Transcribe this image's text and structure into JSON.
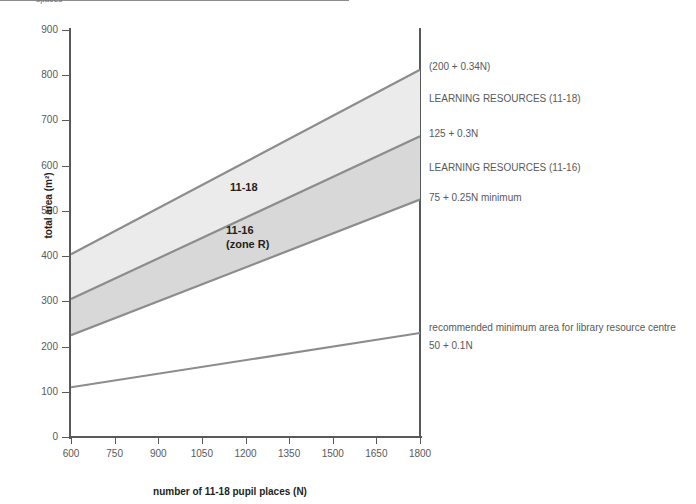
{
  "page": {
    "truncated_top_text": "spaces"
  },
  "chart_data": {
    "type": "area",
    "title": "",
    "xlabel": "number of 11-18 pupil places (N)",
    "ylabel": "total area (m²)",
    "xlim": [
      600,
      1800
    ],
    "ylim": [
      0,
      900
    ],
    "x_ticks": [
      600,
      750,
      900,
      1050,
      1200,
      1350,
      1500,
      1650,
      1800
    ],
    "y_ticks": [
      0,
      100,
      200,
      300,
      400,
      500,
      600,
      700,
      800,
      900
    ],
    "grid": false,
    "legend": "annotations at right of plot",
    "x": [
      600,
      1800
    ],
    "series": [
      {
        "name": "(200 + 0.34N)",
        "formula": "200 + 0.34N",
        "values": [
          404,
          812
        ],
        "role": "upper bound of 11-18 band",
        "color": "#8a8c8e"
      },
      {
        "name": "125 + 0.3N",
        "formula": "125 + 0.3N",
        "values": [
          305,
          665
        ],
        "role": "boundary between 11-18 and 11-16 bands",
        "color": "#8a8c8e"
      },
      {
        "name": "75 + 0.25N minimum",
        "formula": "75 + 0.25N",
        "values": [
          225,
          525
        ],
        "role": "lower bound of 11-16 band",
        "color": "#8a8c8e"
      },
      {
        "name": "50 + 0.1N",
        "formula": "50 + 0.1N",
        "values": [
          110,
          230
        ],
        "role": "recommended minimum area for library resource centre",
        "color": "#8a8c8e"
      }
    ],
    "bands": [
      {
        "name": "11-18",
        "label": "11-18",
        "upper_formula": "200 + 0.34N",
        "lower_formula": "125 + 0.3N",
        "fill": "#ebebeb"
      },
      {
        "name": "11-16 (zone R)",
        "label": "11-16\n(zone R)",
        "upper_formula": "125 + 0.3N",
        "lower_formula": "75 + 0.25N",
        "fill": "#d8d8d8"
      }
    ],
    "annotations": [
      {
        "text": "(200 + 0.34N)"
      },
      {
        "text": "LEARNING RESOURCES (11-18)"
      },
      {
        "text": "125 + 0.3N"
      },
      {
        "text": "LEARNING RESOURCES (11-16)"
      },
      {
        "text": "75 + 0.25N minimum"
      },
      {
        "text": "recommended minimum area for library resource centre"
      },
      {
        "text": "50 + 0.1N"
      }
    ]
  }
}
